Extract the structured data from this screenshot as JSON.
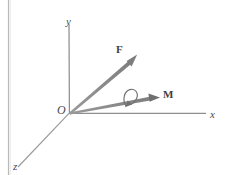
{
  "figure": {
    "kind": "vector-diagram",
    "background_color": "#ffffff",
    "stroke_color": "#8a8a8a",
    "vector_color": "#8a8a8a",
    "label_color": "#4a4a4a",
    "axes": [
      {
        "name": "x-axis",
        "label": "x",
        "direction": "right"
      },
      {
        "name": "y-axis",
        "label": "y",
        "direction": "up"
      },
      {
        "name": "z-axis",
        "label": "z",
        "direction": "down-left"
      }
    ],
    "origin": {
      "label": "O"
    },
    "vectors": [
      {
        "name": "force-vector",
        "label": "F",
        "direction": "up-right"
      },
      {
        "name": "moment-vector",
        "label": "M",
        "direction": "right"
      }
    ],
    "rotation_symbol": {
      "name": "rotation-arrow",
      "about": "M",
      "sense": "counterclockwise"
    },
    "artifact": {
      "name": "scan-line",
      "orientation": "vertical",
      "color": "#b8b8b8"
    }
  }
}
